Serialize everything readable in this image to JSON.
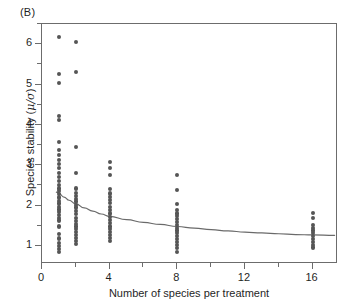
{
  "figure": {
    "panel_label": "(B)",
    "background_color": "#ffffff",
    "frame_color": "#6c6c6c",
    "point_color": "#555555",
    "curve_color": "#6a6a6a"
  },
  "axes": {
    "x": {
      "title": "Number of species per treatment",
      "tick_labels": [
        "0",
        "4",
        "8",
        "12",
        "16"
      ],
      "tick_values": [
        0,
        4,
        8,
        12,
        16
      ],
      "minor_tick_values": [
        2,
        6,
        10,
        14
      ],
      "limits": [
        0,
        17.5
      ]
    },
    "y": {
      "title_prefix": "Species stability (",
      "title_symbol": "μ/σ",
      "title_suffix": ")",
      "title_full": "Species stability (μ/σ)",
      "tick_labels": [
        "1",
        "2",
        "3",
        "4",
        "5",
        "6"
      ],
      "tick_values": [
        1,
        2,
        3,
        4,
        5,
        6
      ],
      "minor_tick_values": [
        0.5,
        1.5,
        2.5,
        3.5,
        4.5,
        5.5,
        6.5
      ],
      "limits": [
        0.55,
        6.5
      ]
    }
  },
  "chart_data": {
    "type": "scatter",
    "title": "(B)",
    "xlabel": "Number of species per treatment",
    "ylabel": "Species stability (μ/σ)",
    "xlim": [
      0,
      17.5
    ],
    "ylim": [
      0.55,
      6.5
    ],
    "grid": false,
    "legend": null,
    "series": [
      {
        "name": "Species stability observations",
        "marker": "filled-circle",
        "color": "#555555",
        "points": [
          {
            "x": 1,
            "y": 6.17
          },
          {
            "x": 1,
            "y": 5.27
          },
          {
            "x": 1,
            "y": 5.03
          },
          {
            "x": 1,
            "y": 4.22
          },
          {
            "x": 1,
            "y": 4.12
          },
          {
            "x": 1,
            "y": 3.57
          },
          {
            "x": 1,
            "y": 3.37
          },
          {
            "x": 1,
            "y": 3.25
          },
          {
            "x": 1,
            "y": 3.12
          },
          {
            "x": 1,
            "y": 3.02
          },
          {
            "x": 1,
            "y": 2.92
          },
          {
            "x": 1,
            "y": 2.8
          },
          {
            "x": 1,
            "y": 2.7
          },
          {
            "x": 1,
            "y": 2.6
          },
          {
            "x": 1,
            "y": 2.5
          },
          {
            "x": 1,
            "y": 2.42
          },
          {
            "x": 1,
            "y": 2.35
          },
          {
            "x": 1,
            "y": 2.28
          },
          {
            "x": 1,
            "y": 2.2
          },
          {
            "x": 1,
            "y": 2.12
          },
          {
            "x": 1,
            "y": 2.05
          },
          {
            "x": 1,
            "y": 1.97
          },
          {
            "x": 1,
            "y": 1.9
          },
          {
            "x": 1,
            "y": 1.83
          },
          {
            "x": 1,
            "y": 1.76
          },
          {
            "x": 1,
            "y": 1.7
          },
          {
            "x": 1,
            "y": 1.63
          },
          {
            "x": 1,
            "y": 1.48
          },
          {
            "x": 1,
            "y": 1.3
          },
          {
            "x": 1,
            "y": 1.18
          },
          {
            "x": 1,
            "y": 1.08
          },
          {
            "x": 1,
            "y": 1.0
          },
          {
            "x": 1,
            "y": 0.93
          },
          {
            "x": 1,
            "y": 0.84
          },
          {
            "x": 2,
            "y": 6.06
          },
          {
            "x": 2,
            "y": 5.31
          },
          {
            "x": 2,
            "y": 3.46
          },
          {
            "x": 2,
            "y": 2.81
          },
          {
            "x": 2,
            "y": 2.42
          },
          {
            "x": 2,
            "y": 2.32
          },
          {
            "x": 2,
            "y": 2.24
          },
          {
            "x": 2,
            "y": 2.17
          },
          {
            "x": 2,
            "y": 2.1
          },
          {
            "x": 2,
            "y": 2.02
          },
          {
            "x": 2,
            "y": 1.95
          },
          {
            "x": 2,
            "y": 1.86
          },
          {
            "x": 2,
            "y": 1.78
          },
          {
            "x": 2,
            "y": 1.7
          },
          {
            "x": 2,
            "y": 1.62
          },
          {
            "x": 2,
            "y": 1.55
          },
          {
            "x": 2,
            "y": 1.48
          },
          {
            "x": 2,
            "y": 1.41
          },
          {
            "x": 2,
            "y": 1.34
          },
          {
            "x": 2,
            "y": 1.27
          },
          {
            "x": 2,
            "y": 1.2
          },
          {
            "x": 2,
            "y": 1.12
          },
          {
            "x": 2,
            "y": 1.05
          },
          {
            "x": 4,
            "y": 3.08
          },
          {
            "x": 4,
            "y": 2.92
          },
          {
            "x": 4,
            "y": 2.76
          },
          {
            "x": 4,
            "y": 2.4
          },
          {
            "x": 4,
            "y": 2.3
          },
          {
            "x": 4,
            "y": 2.22
          },
          {
            "x": 4,
            "y": 2.14
          },
          {
            "x": 4,
            "y": 2.06
          },
          {
            "x": 4,
            "y": 1.96
          },
          {
            "x": 4,
            "y": 1.88
          },
          {
            "x": 4,
            "y": 1.8
          },
          {
            "x": 4,
            "y": 1.72
          },
          {
            "x": 4,
            "y": 1.64
          },
          {
            "x": 4,
            "y": 1.56
          },
          {
            "x": 4,
            "y": 1.48
          },
          {
            "x": 4,
            "y": 1.41
          },
          {
            "x": 4,
            "y": 1.34
          },
          {
            "x": 4,
            "y": 1.27
          },
          {
            "x": 4,
            "y": 1.2
          },
          {
            "x": 4,
            "y": 1.13
          },
          {
            "x": 8,
            "y": 2.76
          },
          {
            "x": 8,
            "y": 2.38
          },
          {
            "x": 8,
            "y": 2.03
          },
          {
            "x": 8,
            "y": 1.88
          },
          {
            "x": 8,
            "y": 1.8
          },
          {
            "x": 8,
            "y": 1.73
          },
          {
            "x": 8,
            "y": 1.66
          },
          {
            "x": 8,
            "y": 1.59
          },
          {
            "x": 8,
            "y": 1.52
          },
          {
            "x": 8,
            "y": 1.45
          },
          {
            "x": 8,
            "y": 1.38
          },
          {
            "x": 8,
            "y": 1.31
          },
          {
            "x": 8,
            "y": 1.24
          },
          {
            "x": 8,
            "y": 1.17
          },
          {
            "x": 8,
            "y": 1.1
          },
          {
            "x": 8,
            "y": 1.02
          },
          {
            "x": 8,
            "y": 0.94
          },
          {
            "x": 8,
            "y": 0.84
          },
          {
            "x": 16,
            "y": 1.82
          },
          {
            "x": 16,
            "y": 1.7
          },
          {
            "x": 16,
            "y": 1.52
          },
          {
            "x": 16,
            "y": 1.45
          },
          {
            "x": 16,
            "y": 1.38
          },
          {
            "x": 16,
            "y": 1.31
          },
          {
            "x": 16,
            "y": 1.24
          },
          {
            "x": 16,
            "y": 1.17
          },
          {
            "x": 16,
            "y": 1.1
          },
          {
            "x": 16,
            "y": 1.03
          },
          {
            "x": 16,
            "y": 0.96
          }
        ]
      }
    ],
    "fit_curve": {
      "name": "fitted decay curve",
      "color": "#6a6a6a",
      "points": [
        {
          "x": 0.85,
          "y": 2.33
        },
        {
          "x": 1.0,
          "y": 2.3
        },
        {
          "x": 1.3,
          "y": 2.21
        },
        {
          "x": 1.6,
          "y": 2.13
        },
        {
          "x": 2.0,
          "y": 2.04
        },
        {
          "x": 2.5,
          "y": 1.94
        },
        {
          "x": 3.0,
          "y": 1.86
        },
        {
          "x": 3.5,
          "y": 1.79
        },
        {
          "x": 4.0,
          "y": 1.73
        },
        {
          "x": 5.0,
          "y": 1.65
        },
        {
          "x": 6.0,
          "y": 1.58
        },
        {
          "x": 7.0,
          "y": 1.53
        },
        {
          "x": 8.0,
          "y": 1.48
        },
        {
          "x": 9.0,
          "y": 1.44
        },
        {
          "x": 10.0,
          "y": 1.4
        },
        {
          "x": 11.0,
          "y": 1.37
        },
        {
          "x": 12.0,
          "y": 1.34
        },
        {
          "x": 13.0,
          "y": 1.32
        },
        {
          "x": 14.0,
          "y": 1.3
        },
        {
          "x": 15.0,
          "y": 1.28
        },
        {
          "x": 16.0,
          "y": 1.27
        },
        {
          "x": 17.3,
          "y": 1.26
        }
      ]
    }
  }
}
